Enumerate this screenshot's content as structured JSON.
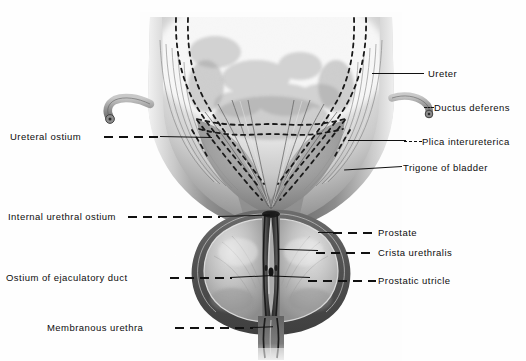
{
  "figure": {
    "view": "anterior coronal cut-away",
    "background_color": "#fefefe",
    "ink_color": "#111111"
  },
  "labels": {
    "left": [
      {
        "id": "ureteral-ostium",
        "text": "Ureteral  ostium",
        "x": 10,
        "y": 131,
        "leader_style": "dash-then-solid"
      },
      {
        "id": "internal-urethral-ostium",
        "text": "Internal urethral ostium",
        "x": 8,
        "y": 211,
        "leader_style": "long-dash"
      },
      {
        "id": "ostium-ejaculatory-duct",
        "text": "Ostium of ejaculatory duct",
        "x": 6,
        "y": 272,
        "leader_style": "long-dash"
      },
      {
        "id": "membranous-urethra",
        "text": "Membranous urethra",
        "x": 47,
        "y": 322,
        "leader_style": "long-dash"
      }
    ],
    "right": [
      {
        "id": "ureter",
        "text": "Ureter",
        "x": 428,
        "y": 68,
        "leader_style": "solid"
      },
      {
        "id": "ductus-deferens",
        "text": "Ductus  deferens",
        "x": 434,
        "y": 102,
        "leader_style": "short-dash"
      },
      {
        "id": "plica-interureterica",
        "text": "Plica interureterica",
        "x": 422,
        "y": 136,
        "leader_style": "short-dash"
      },
      {
        "id": "trigone-of-bladder",
        "text": "Trigone of bladder",
        "x": 403,
        "y": 162,
        "leader_style": "solid"
      },
      {
        "id": "prostate",
        "text": "Prostate",
        "x": 378,
        "y": 227,
        "leader_style": "long-dash"
      },
      {
        "id": "crista-urethralis",
        "text": "Crista  urethralis",
        "x": 378,
        "y": 247,
        "leader_style": "long-dash"
      },
      {
        "id": "prostatic-utricle",
        "text": "Prostatic  utricle",
        "x": 378,
        "y": 275,
        "leader_style": "long-dash"
      }
    ]
  },
  "structures": [
    {
      "id": "bladder-wall",
      "name": "Urinary bladder (opened)"
    },
    {
      "id": "bladder-cavity",
      "name": "Bladder lumen mucosa"
    },
    {
      "id": "trigone",
      "name": "Trigone of bladder"
    },
    {
      "id": "ureter-left-stub",
      "name": "Left ureter stump"
    },
    {
      "id": "ductus-deferens-stub",
      "name": "Right ductus deferens stump"
    },
    {
      "id": "intramural-ureter",
      "name": "Intramural course of ureters (dotted)"
    },
    {
      "id": "prostate-gland",
      "name": "Prostate gland"
    },
    {
      "id": "prostatic-urethra",
      "name": "Prostatic urethra"
    },
    {
      "id": "crista-urethralis",
      "name": "Crista urethralis (urethral crest)"
    },
    {
      "id": "membranous-urethra",
      "name": "Membranous urethra"
    }
  ]
}
